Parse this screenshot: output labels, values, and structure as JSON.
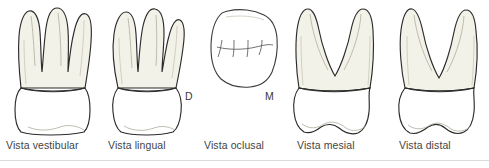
{
  "figure": {
    "background_color": "#ffffff",
    "outline_color": "#2b2b2b",
    "root_fill_color": "#f3f2e8",
    "crown_fill_color": "#ffffff",
    "caption_color": "#444444",
    "divider_color": "#dcdcdc"
  },
  "views": [
    {
      "id": "vestibular",
      "caption": "Vista vestibular",
      "root_count": 3,
      "description": "Three splayed roots with rounded apices above a wide crown"
    },
    {
      "id": "lingual",
      "caption": "Vista lingual",
      "root_count": 3,
      "description": "Three roots above a tapering crown"
    },
    {
      "id": "oclusal",
      "caption": "Vista oclusal",
      "root_count": 0,
      "description": "Rounded rhomboid occlusal table with central groove and fissures",
      "orientation_labels": {
        "left": "D",
        "right": "M"
      }
    },
    {
      "id": "mesial",
      "caption": "Vista mesial",
      "root_count": 2,
      "description": "Wide V-shaped root bifurcation above a crown with wavy occlusal edge"
    },
    {
      "id": "distal",
      "caption": "Vista distal",
      "root_count": 2,
      "description": "V-shaped roots above a crown with wavy occlusal edge"
    }
  ]
}
